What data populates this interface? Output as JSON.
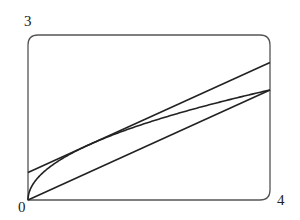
{
  "chart_data": {
    "type": "line",
    "title": "",
    "xlabel": "",
    "ylabel": "",
    "xlim": [
      0,
      4
    ],
    "ylim": [
      0,
      3
    ],
    "grid": false,
    "legend": null,
    "tick_labels": {
      "x_min": "0",
      "x_max": "4",
      "y_max": "3"
    },
    "series": [
      {
        "name": "curve y = sqrt(x)",
        "x": [
          0,
          0.25,
          0.5,
          1,
          1.5,
          2,
          2.5,
          3,
          3.5,
          4
        ],
        "y": [
          0,
          0.5,
          0.707,
          1,
          1.225,
          1.414,
          1.581,
          1.732,
          1.871,
          2
        ]
      },
      {
        "name": "secant line y = x/2",
        "x": [
          0,
          4
        ],
        "y": [
          0,
          2
        ]
      },
      {
        "name": "tangent line y = x/2 + 1/2",
        "x": [
          0,
          4
        ],
        "y": [
          0.5,
          2.5
        ]
      }
    ]
  },
  "labels": {
    "origin": "0",
    "x_max": "4",
    "y_max": "3"
  },
  "colors": {
    "line": "#222222",
    "frame": "#555555"
  }
}
